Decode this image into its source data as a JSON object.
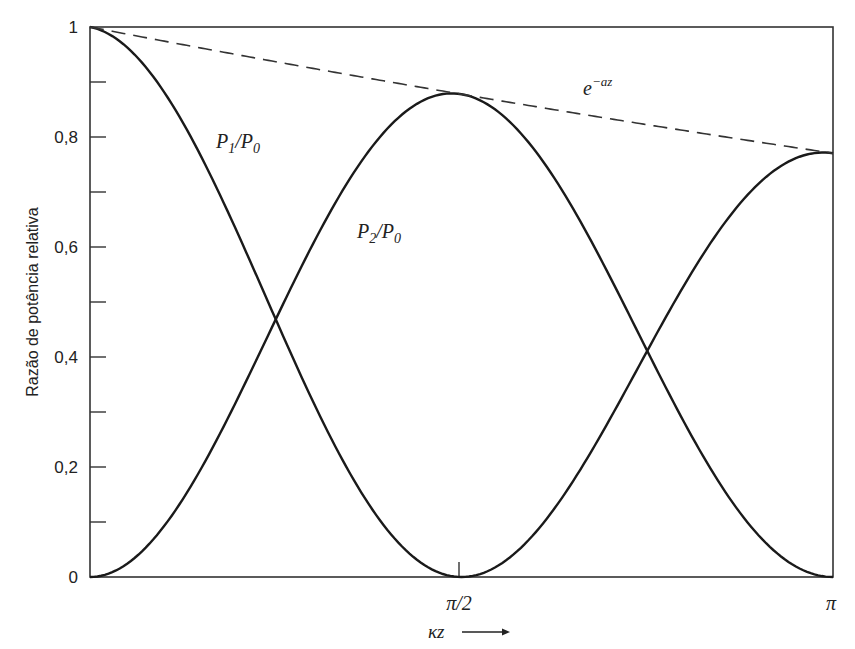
{
  "chart_data": {
    "type": "line",
    "title": "",
    "xlabel": "κz",
    "ylabel": "Razão de potência relativa",
    "xlim": [
      0,
      3.14159
    ],
    "ylim": [
      0,
      1
    ],
    "grid": false,
    "legend_position": "inline labels",
    "x_ticks": [
      {
        "value": 1.5708,
        "label": "π/2"
      },
      {
        "value": 3.14159,
        "label": "π"
      }
    ],
    "y_ticks": [
      {
        "value": 0,
        "label": "0"
      },
      {
        "value": 0.1,
        "label": ""
      },
      {
        "value": 0.2,
        "label": "0,2"
      },
      {
        "value": 0.3,
        "label": ""
      },
      {
        "value": 0.4,
        "label": "0,4"
      },
      {
        "value": 0.5,
        "label": ""
      },
      {
        "value": 0.6,
        "label": "0,6"
      },
      {
        "value": 0.7,
        "label": ""
      },
      {
        "value": 0.8,
        "label": "0,8"
      },
      {
        "value": 0.9,
        "label": ""
      },
      {
        "value": 1,
        "label": "1"
      }
    ],
    "attenuation_per_rad": 0.083,
    "x": [
      0,
      0.3927,
      0.7854,
      1.1781,
      1.5708,
      1.9635,
      2.3562,
      2.7489,
      3.1416
    ],
    "series": [
      {
        "name": "P1/P0",
        "label_main": "P",
        "label_sub1": "1",
        "label_div": "/P",
        "label_sub2": "0",
        "formula": "exp(-a*x)*cos^2(x)",
        "style": "solid",
        "values": [
          1.0,
          0.826,
          0.468,
          0.133,
          0.0,
          0.116,
          0.411,
          0.704,
          0.771
        ]
      },
      {
        "name": "P2/P0",
        "label_main": "P",
        "label_sub1": "2",
        "label_div": "/P",
        "label_sub2": "0",
        "formula": "exp(-a*x)*sin^2(x)",
        "style": "solid",
        "values": [
          0.0,
          0.142,
          0.468,
          0.776,
          0.878,
          0.705,
          0.411,
          0.117,
          0.0
        ]
      },
      {
        "name": "e^-az",
        "label_main": "e",
        "label_sup": "−az",
        "formula": "exp(-a*x)",
        "style": "dashed",
        "values": [
          1.0,
          0.968,
          0.937,
          0.907,
          0.878,
          0.85,
          0.822,
          0.796,
          0.771
        ]
      }
    ],
    "annotations": [
      {
        "text": "κz →",
        "position": "below x-axis near π/2"
      },
      {
        "text": "tick mark at π/2 on x-axis"
      }
    ]
  }
}
